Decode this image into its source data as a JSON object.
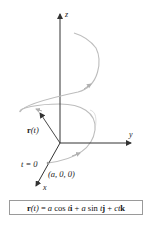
{
  "figure": {
    "axes": {
      "z_label": "z",
      "y_label": "y",
      "x_label": "x"
    },
    "vector_label_bold": "r",
    "vector_label_arg": "(t)",
    "start_label": "t = 0",
    "start_point_label": "(a, 0, 0)",
    "formula": {
      "r": "r",
      "arg": "(t)",
      "eq": " = ",
      "a1": "a",
      "cos": " cos ",
      "t1": "t",
      "i": "i",
      "plus1": " + ",
      "a2": "a",
      "sin": " sin ",
      "t2": "t",
      "j": "j",
      "plus2": " + ",
      "ct": "ct",
      "k": "k"
    },
    "colors": {
      "axis": "#333333",
      "helix": "#b5b5b5",
      "box_border": "#9a9a9a"
    }
  }
}
